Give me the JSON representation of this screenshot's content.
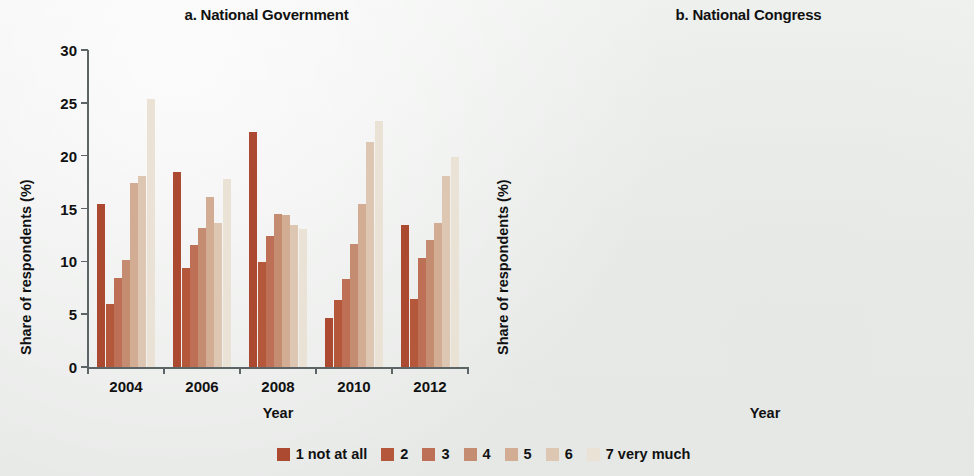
{
  "figure": {
    "background_color": "#eef0ee",
    "axis_color": "#5c6466",
    "y_axis_title": "Share of respondents (%)",
    "x_axis_title": "Year"
  },
  "legend": {
    "position": "bottom-center",
    "items": [
      {
        "label": "1 not at all",
        "color": "#ab4a30"
      },
      {
        "label": "2",
        "color": "#b4573b"
      },
      {
        "label": "3",
        "color": "#bd7055"
      },
      {
        "label": "4",
        "color": "#c48d71"
      },
      {
        "label": "5",
        "color": "#d2ad93"
      },
      {
        "label": "6",
        "color": "#ddc7b2"
      },
      {
        "label": "7 very much",
        "color": "#ebe2d6"
      }
    ]
  },
  "chart_data": [
    {
      "type": "bar",
      "panel": "a",
      "title": "a. National Government",
      "xlabel": "Year",
      "ylabel": "Share of respondents (%)",
      "ylim": [
        0,
        30
      ],
      "yticks": [
        0,
        5,
        10,
        15,
        20,
        25,
        30
      ],
      "grid": false,
      "categories": [
        "2004",
        "2006",
        "2008",
        "2010",
        "2012"
      ],
      "series": [
        {
          "name": "1 not at all",
          "color": "#ab4a30",
          "values": [
            15.4,
            18.5,
            22.2,
            4.6,
            13.4
          ]
        },
        {
          "name": "2",
          "color": "#b4573b",
          "values": [
            6.0,
            9.4,
            9.9,
            6.3,
            6.4
          ]
        },
        {
          "name": "3",
          "color": "#bd7055",
          "values": [
            8.4,
            11.5,
            12.4,
            8.3,
            10.3
          ]
        },
        {
          "name": "4",
          "color": "#c48d71",
          "values": [
            10.1,
            13.2,
            14.5,
            11.6,
            12.0
          ]
        },
        {
          "name": "5",
          "color": "#d2ad93",
          "values": [
            17.4,
            16.1,
            14.4,
            15.4,
            13.6
          ]
        },
        {
          "name": "6",
          "color": "#ddc7b2",
          "values": [
            18.1,
            13.6,
            13.4,
            21.3,
            18.1
          ]
        },
        {
          "name": "7 very much",
          "color": "#ebe2d6",
          "values": [
            25.4,
            17.8,
            13.1,
            23.3,
            19.9
          ]
        }
      ]
    },
    {
      "type": "bar",
      "panel": "b",
      "title": "b. National Congress",
      "xlabel": "Year",
      "ylabel": "Share of respondents (%)",
      "ylim": [
        0,
        30
      ],
      "yticks": [
        0,
        5,
        10,
        15,
        20,
        25,
        30
      ],
      "grid": false,
      "categories": [
        "2004",
        "2006",
        "2008",
        "2010",
        "2012"
      ],
      "series": [
        {
          "name": "1 not at all",
          "color": "#ab4a30",
          "values": [
            15.2,
            17.2,
            25.6,
            8.7,
            17.7
          ]
        },
        {
          "name": "2",
          "color": "#b4573b",
          "values": [
            9.5,
            9.3,
            11.0,
            9.0,
            9.1
          ]
        },
        {
          "name": "3",
          "color": "#bd7055",
          "values": [
            12.4,
            13.5,
            14.8,
            14.3,
            12.7
          ]
        },
        {
          "name": "4",
          "color": "#c48d71",
          "values": [
            14.4,
            17.5,
            16.9,
            23.4,
            16.6
          ]
        },
        {
          "name": "5",
          "color": "#d2ad93",
          "values": [
            19.3,
            20.0,
            14.9,
            22.4,
            18.9
          ]
        },
        {
          "name": "6",
          "color": "#ddc7b2",
          "values": [
            14.3,
            12.2,
            9.1,
            14.5,
            14.0
          ]
        },
        {
          "name": "7 very much",
          "color": "#ebe2d6",
          "values": [
            14.4,
            10.1,
            6.8,
            6.4,
            12.0
          ]
        }
      ]
    }
  ]
}
